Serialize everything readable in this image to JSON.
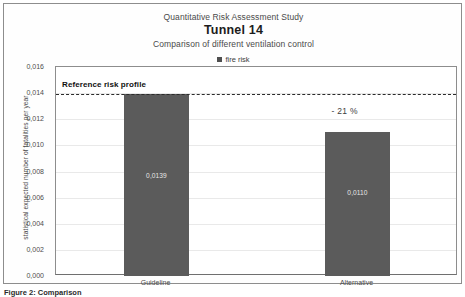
{
  "figure": {
    "caption": "Figure 2: Comparison",
    "legend_label": "fire risk",
    "legend_icon": "square-swatch-icon"
  },
  "chart_data": {
    "type": "bar",
    "supertitle": "Quantitative Risk Assessment Study",
    "title": "Tunnel 14",
    "subtitle": "Comparison of different ventilation control",
    "categories": [
      "Guideline",
      "Alternative"
    ],
    "values": [
      0.0139,
      0.011
    ],
    "value_labels": [
      "0,0139",
      "0,0110"
    ],
    "series": [
      {
        "name": "fire risk",
        "values": [
          0.0139,
          0.011
        ]
      }
    ],
    "xlabel": "",
    "ylabel": "statistical expected number of fatalities per year",
    "ylim": [
      0.0,
      0.016
    ],
    "ytick_values": [
      0.016,
      0.014,
      0.012,
      0.01,
      0.008,
      0.006,
      0.004,
      0.002,
      0.0
    ],
    "ytick_labels": [
      "0,016",
      "0,014",
      "0,012",
      "0,010",
      "0,008",
      "0,006",
      "0,004",
      "0,002",
      "0,000"
    ],
    "grid": true,
    "legend_position": "top-center",
    "bar_color": "#5b5b5b",
    "reference_line": {
      "label": "Reference risk profile",
      "value": 0.0139,
      "style": "dashed",
      "color": "#2b2b2b"
    },
    "annotations": [
      {
        "text": "- 21 %",
        "target": "Alternative"
      }
    ]
  }
}
